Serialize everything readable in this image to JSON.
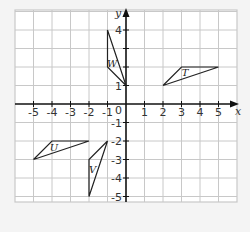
{
  "diagram": {
    "type": "coordinate-grid",
    "x_axis": {
      "label": "x",
      "min": -6,
      "max": 6,
      "tick_labels": [
        "-5",
        "-4",
        "-3",
        "-2",
        "-1",
        "1",
        "2",
        "3",
        "4",
        "5"
      ]
    },
    "y_axis": {
      "label": "y",
      "min": -5,
      "max": 5,
      "tick_labels": [
        "4",
        "1",
        "-1",
        "-2",
        "-3",
        "-4",
        "-5"
      ]
    },
    "origin_label": "0",
    "colors": {
      "grid": "#c8c8c8",
      "axis": "#111111",
      "shape": "#222222",
      "background": "#ffffff",
      "page": "#f4f4f4"
    },
    "shapes": [
      {
        "name": "W",
        "vertices": [
          [
            -1,
            4
          ],
          [
            -1,
            2
          ],
          [
            0,
            1
          ]
        ],
        "label_pos": [
          -0.75,
          2.2
        ]
      },
      {
        "name": "T",
        "vertices": [
          [
            2,
            1
          ],
          [
            3,
            2
          ],
          [
            5,
            2
          ]
        ],
        "label_pos": [
          3.2,
          1.75
        ]
      },
      {
        "name": "U",
        "vertices": [
          [
            -5,
            -3
          ],
          [
            -4,
            -2
          ],
          [
            -2,
            -2
          ]
        ],
        "label_pos": [
          -3.9,
          -2.3
        ]
      },
      {
        "name": "V",
        "vertices": [
          [
            -1,
            -2
          ],
          [
            -2,
            -3
          ],
          [
            -2,
            -5
          ]
        ],
        "label_pos": [
          -1.8,
          -3.5
        ]
      }
    ]
  }
}
